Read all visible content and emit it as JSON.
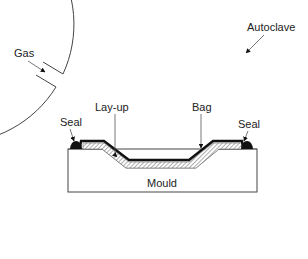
{
  "diagram": {
    "labels": {
      "autoclave": "Autoclave",
      "gas": "Gas",
      "layup": "Lay-up",
      "bag": "Bag",
      "seal_left": "Seal",
      "seal_right": "Seal",
      "mould": "Mould"
    },
    "colors": {
      "line": "#333333",
      "bag": "#111111",
      "layup_hatch": "#777777",
      "background": "#ffffff"
    }
  }
}
